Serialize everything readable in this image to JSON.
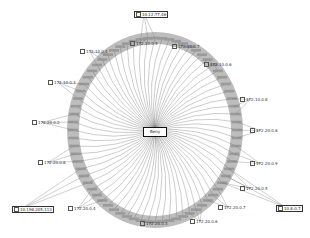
{
  "graph": {
    "center_node": {
      "label": "Beny",
      "icon": "host-icon"
    },
    "outer_nodes": [
      {
        "id": "n_top",
        "label": "10.12.77.46",
        "x": 134,
        "y": 11,
        "boxed": true
      },
      {
        "id": "n1",
        "label": "172.10.0.5",
        "x": 130,
        "y": 41
      },
      {
        "id": "n2",
        "label": "172.10.0.7",
        "x": 172,
        "y": 44
      },
      {
        "id": "n3",
        "label": "172.10.0.4",
        "x": 80,
        "y": 49
      },
      {
        "id": "n4",
        "label": "172.10.0.6",
        "x": 204,
        "y": 62
      },
      {
        "id": "n5",
        "label": "172.10.0.3",
        "x": 48,
        "y": 80
      },
      {
        "id": "n6",
        "label": "172.10.0.8",
        "x": 240,
        "y": 97
      },
      {
        "id": "n7",
        "label": "172.20.0.2",
        "x": 32,
        "y": 120
      },
      {
        "id": "n8",
        "label": "172.20.0.6",
        "x": 250,
        "y": 128
      },
      {
        "id": "n9",
        "label": "172.20.0.8",
        "x": 38,
        "y": 160
      },
      {
        "id": "n10",
        "label": "172.20.0.9",
        "x": 250,
        "y": 161
      },
      {
        "id": "n11",
        "label": "172.20.0.5",
        "x": 240,
        "y": 186
      },
      {
        "id": "n12",
        "label": "10.198.205.113",
        "x": 12,
        "y": 206,
        "boxed": true
      },
      {
        "id": "n13",
        "label": "172.20.0.4",
        "x": 68,
        "y": 206
      },
      {
        "id": "n14",
        "label": "172.20.0.7",
        "x": 218,
        "y": 205
      },
      {
        "id": "n15",
        "label": "10.8.0.7",
        "x": 276,
        "y": 205,
        "boxed": true
      },
      {
        "id": "n16",
        "label": "172.20.0.3",
        "x": 140,
        "y": 221
      },
      {
        "id": "n17",
        "label": "172.20.0.6",
        "x": 190,
        "y": 219
      }
    ],
    "ring": {
      "cx": 155,
      "cy": 130,
      "rx": 82,
      "ry": 92,
      "node_count": 72,
      "fill": "#bdbdbd",
      "edge_color": "#555555"
    }
  }
}
